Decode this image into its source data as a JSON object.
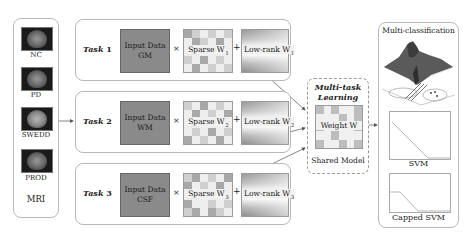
{
  "mri": {
    "title": "MRI",
    "scans": [
      {
        "label": "NC"
      },
      {
        "label": "PD"
      },
      {
        "label": "SWEDD"
      },
      {
        "label": "PROD"
      }
    ]
  },
  "tasks": [
    {
      "label": "Task",
      "num": "1",
      "input_line1": "Input Data",
      "input_line2": "GM",
      "times": "×",
      "sparse": "Sparse W",
      "sparse_sub": "1",
      "plus": "+",
      "lowrank": "Low-rank W",
      "lowrank_sub": "1"
    },
    {
      "label": "Task",
      "num": "2",
      "input_line1": "Input Data",
      "input_line2": "WM",
      "times": "×",
      "sparse": "Sparse W",
      "sparse_sub": "2",
      "plus": "+",
      "lowrank": "Low-rank W",
      "lowrank_sub": "2"
    },
    {
      "label": "Task",
      "num": "3",
      "input_line1": "Input Data",
      "input_line2": "CSF",
      "times": "×",
      "sparse": "Sparse W",
      "sparse_sub": "3",
      "plus": "+",
      "lowrank": "Low-rank W",
      "lowrank_sub": "3"
    }
  ],
  "shared": {
    "title_line1": "Multi-task",
    "title_line2": "Learning",
    "weight": "Weight W",
    "footer": "Shared Model"
  },
  "output": {
    "title": "Multi-classification",
    "plots": [
      {
        "label": "SVM"
      },
      {
        "label": "Capped SVM"
      }
    ]
  }
}
